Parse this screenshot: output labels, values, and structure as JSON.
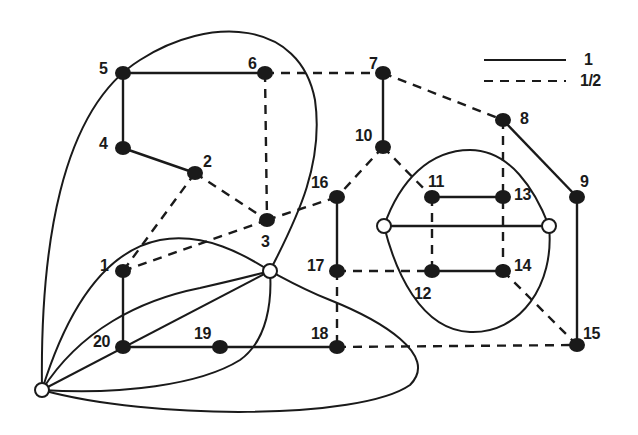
{
  "legend": {
    "items": [
      {
        "style": "solid",
        "label": "1"
      },
      {
        "style": "dashed",
        "label": "1/2"
      }
    ]
  },
  "colors": {
    "ink": "#1a1a1a",
    "background": "#ffffff",
    "hollow_fill": "#ffffff"
  },
  "nodes": [
    {
      "id": "1",
      "x": 123,
      "y": 271,
      "type": "filled",
      "label": "1",
      "lx": 100,
      "ly": 258
    },
    {
      "id": "2",
      "x": 195,
      "y": 173,
      "type": "filled",
      "label": "2",
      "lx": 203,
      "ly": 154
    },
    {
      "id": "3",
      "x": 267,
      "y": 220,
      "type": "filled",
      "label": "3",
      "lx": 261,
      "ly": 234
    },
    {
      "id": "4",
      "x": 123,
      "y": 148,
      "type": "filled",
      "label": "4",
      "lx": 99,
      "ly": 136
    },
    {
      "id": "5",
      "x": 123,
      "y": 73,
      "type": "filled",
      "label": "5",
      "lx": 99,
      "ly": 61
    },
    {
      "id": "6",
      "x": 265,
      "y": 73,
      "type": "filled",
      "label": "6",
      "lx": 248,
      "ly": 56
    },
    {
      "id": "7",
      "x": 383,
      "y": 73,
      "type": "filled",
      "label": "7",
      "lx": 369,
      "ly": 56
    },
    {
      "id": "8",
      "x": 503,
      "y": 120,
      "type": "filled",
      "label": "8",
      "lx": 520,
      "ly": 111
    },
    {
      "id": "9",
      "x": 577,
      "y": 197,
      "type": "filled",
      "label": "9",
      "lx": 580,
      "ly": 174
    },
    {
      "id": "10",
      "x": 383,
      "y": 147,
      "type": "filled",
      "label": "10",
      "lx": 355,
      "ly": 128
    },
    {
      "id": "11",
      "x": 432,
      "y": 197,
      "type": "filled",
      "label": "11",
      "lx": 428,
      "ly": 174
    },
    {
      "id": "12",
      "x": 432,
      "y": 271,
      "type": "filled",
      "label": "12",
      "lx": 414,
      "ly": 286
    },
    {
      "id": "13",
      "x": 503,
      "y": 197,
      "type": "filled",
      "label": "13",
      "lx": 514,
      "ly": 187
    },
    {
      "id": "14",
      "x": 503,
      "y": 271,
      "type": "filled",
      "label": "14",
      "lx": 514,
      "ly": 258
    },
    {
      "id": "15",
      "x": 577,
      "y": 345,
      "type": "filled",
      "label": "15",
      "lx": 583,
      "ly": 326
    },
    {
      "id": "16",
      "x": 337,
      "y": 197,
      "type": "filled",
      "label": "16",
      "lx": 311,
      "ly": 175
    },
    {
      "id": "17",
      "x": 337,
      "y": 271,
      "type": "filled",
      "label": "17",
      "lx": 307,
      "ly": 258
    },
    {
      "id": "18",
      "x": 337,
      "y": 347,
      "type": "filled",
      "label": "18",
      "lx": 311,
      "ly": 326
    },
    {
      "id": "19",
      "x": 220,
      "y": 347,
      "type": "filled",
      "label": "19",
      "lx": 194,
      "ly": 326
    },
    {
      "id": "20",
      "x": 123,
      "y": 347,
      "type": "filled",
      "label": "20",
      "lx": 93,
      "ly": 334
    },
    {
      "id": "hubL",
      "x": 42,
      "y": 390,
      "type": "hollow",
      "label": ""
    },
    {
      "id": "hubC",
      "x": 270,
      "y": 271,
      "type": "hollow",
      "label": ""
    },
    {
      "id": "hubW",
      "x": 384,
      "y": 226,
      "type": "hollow",
      "label": ""
    },
    {
      "id": "hubE",
      "x": 549,
      "y": 226,
      "type": "hollow",
      "label": ""
    }
  ],
  "edges": [
    {
      "from": "5",
      "to": "6",
      "weight": "1"
    },
    {
      "from": "5",
      "to": "4",
      "weight": "1"
    },
    {
      "from": "4",
      "to": "2",
      "weight": "1"
    },
    {
      "from": "7",
      "to": "10",
      "weight": "1"
    },
    {
      "from": "8",
      "to": "9",
      "weight": "1"
    },
    {
      "from": "9",
      "to": "15",
      "weight": "1"
    },
    {
      "from": "11",
      "to": "13",
      "weight": "1"
    },
    {
      "from": "12",
      "to": "14",
      "weight": "1"
    },
    {
      "from": "16",
      "to": "17",
      "weight": "1"
    },
    {
      "from": "1",
      "to": "20",
      "weight": "1"
    },
    {
      "from": "20",
      "to": "19",
      "weight": "1"
    },
    {
      "from": "19",
      "to": "18",
      "weight": "1"
    },
    {
      "from": "hubW",
      "to": "hubE",
      "weight": "1"
    },
    {
      "from": "6",
      "to": "7",
      "weight": "1/2"
    },
    {
      "from": "6",
      "to": "3",
      "weight": "1/2"
    },
    {
      "from": "7",
      "to": "8",
      "weight": "1/2"
    },
    {
      "from": "2",
      "to": "3",
      "weight": "1/2"
    },
    {
      "from": "2",
      "to": "1",
      "weight": "1/2"
    },
    {
      "from": "1",
      "to": "3",
      "weight": "1/2"
    },
    {
      "from": "3",
      "to": "16",
      "weight": "1/2"
    },
    {
      "from": "10",
      "to": "16",
      "weight": "1/2"
    },
    {
      "from": "10",
      "to": "11",
      "weight": "1/2"
    },
    {
      "from": "8",
      "to": "14",
      "weight": "1/2"
    },
    {
      "from": "11",
      "to": "12",
      "weight": "1/2"
    },
    {
      "from": "17",
      "to": "12",
      "weight": "1/2"
    },
    {
      "from": "17",
      "to": "18",
      "weight": "1/2"
    },
    {
      "from": "18",
      "to": "15",
      "weight": "1/2"
    },
    {
      "from": "14",
      "to": "15",
      "weight": "1/2"
    }
  ]
}
